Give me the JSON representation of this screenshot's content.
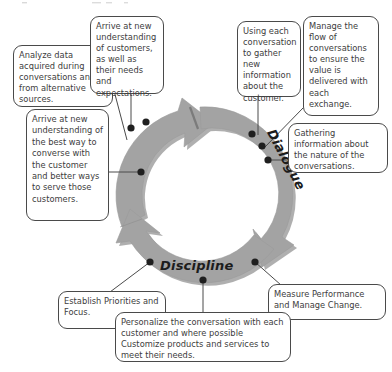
{
  "diagram": {
    "ring_colors": {
      "arrow_fill": "#a0a0a0",
      "arrow_shadow": "#7c7c7c",
      "outline": "#8a8a8a"
    },
    "phases": [
      {
        "id": "discovery",
        "label": "Discovery"
      },
      {
        "id": "dialogue",
        "label": "Dialogue"
      },
      {
        "id": "discipline",
        "label": "Discipline"
      }
    ],
    "callouts": [
      {
        "id": "analyze-data",
        "phase": "discovery",
        "text": "Analyze data acquired during conversations and from alternative sources."
      },
      {
        "id": "arrive-customers",
        "phase": "discovery",
        "text": "Arrive at new understanding of customers, as well as their needs and expectations."
      },
      {
        "id": "arrive-best-way",
        "phase": "discovery",
        "text": "Arrive at new understanding of the best way  to converse with the customer and better ways to serve those customers."
      },
      {
        "id": "using-each",
        "phase": "dialogue",
        "text": "Using each conversation to gather new information about the customer."
      },
      {
        "id": "manage-flow",
        "phase": "dialogue",
        "text": "Manage the flow of conversations to ensure the value is delivered with each exchange."
      },
      {
        "id": "gathering-info",
        "phase": "dialogue",
        "text": "Gathering information about the nature of the conversations."
      },
      {
        "id": "establish-priorities",
        "phase": "discipline",
        "text": "Establish Priorities and Focus."
      },
      {
        "id": "personalize",
        "phase": "discipline",
        "text": "Personalize the conversation with each customer and where possible Customize products and services to meet their needs."
      },
      {
        "id": "measure-performance",
        "phase": "discipline",
        "text": "Measure Performance and Manage Change."
      }
    ]
  }
}
